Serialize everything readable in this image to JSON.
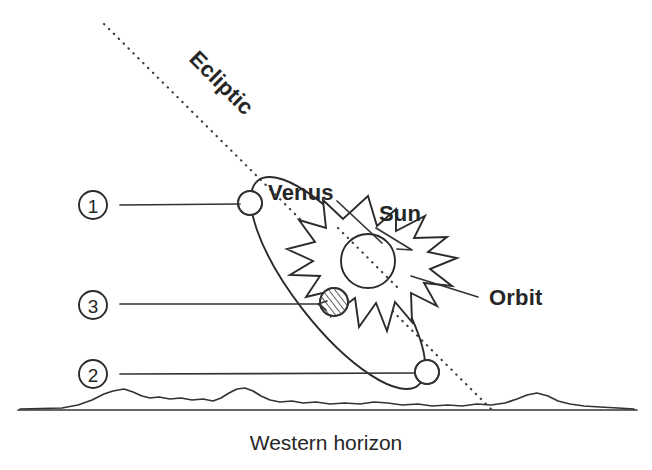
{
  "diagram": {
    "caption": "Western horizon",
    "labels": {
      "ecliptic": "Ecliptic",
      "venus": "Venus",
      "sun": "Sun",
      "orbit": "Orbit"
    },
    "markers": [
      {
        "id": "marker-1",
        "label": "1",
        "cx": 93,
        "cy": 205,
        "leader_x1": 120,
        "leader_x2": 243,
        "leader_y": 205
      },
      {
        "id": "marker-3",
        "label": "3",
        "cx": 93,
        "cy": 305,
        "leader_x1": 120,
        "leader_x2": 318,
        "leader_y": 304
      },
      {
        "id": "marker-2",
        "label": "2",
        "cx": 93,
        "cy": 374,
        "leader_x1": 120,
        "leader_x2": 414,
        "leader_y": 374
      }
    ],
    "planet_positions": [
      {
        "name": "venus-position-1",
        "cx": 250,
        "cy": 203,
        "r": 12,
        "phase": "crescent-left"
      },
      {
        "name": "venus-position-3",
        "cx": 334,
        "cy": 302,
        "r": 14,
        "phase": "full-hatched"
      },
      {
        "name": "venus-position-2",
        "cx": 427,
        "cy": 372,
        "r": 12,
        "phase": "crescent-right"
      }
    ],
    "sun": {
      "cx": 368,
      "cy": 261,
      "core_r": 27
    },
    "ecliptic_line": {
      "x1": 104,
      "y1": 24,
      "x2": 491,
      "y2": 409,
      "rotation_deg": 44.8
    },
    "horizon": {
      "baseline_y": 410,
      "x_start": 18,
      "x_end": 637
    },
    "colors": {
      "ink": "#2b2b2b",
      "background": "#ffffff",
      "label_text": "#262626"
    }
  }
}
